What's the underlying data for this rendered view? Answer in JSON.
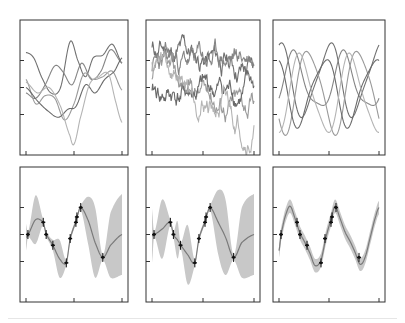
{
  "figure": {
    "title": "",
    "layout": {
      "rows": 2,
      "cols": 3
    },
    "colors": {
      "axis": "#333333",
      "sample_lines": [
        "#707070",
        "#858585",
        "#9a9a9a",
        "#6a6a6a",
        "#b4b4b4"
      ],
      "mean_line": "#7a7a7a",
      "band": "#c8c8c8",
      "observations": "#111111"
    }
  },
  "chart_data": [
    {
      "id": "prior-smooth",
      "type": "line",
      "title": "",
      "xlabel": "",
      "ylabel": "",
      "description": "Prior samples, smooth (RBF) kernel",
      "xlim": [
        0,
        1
      ],
      "ylim": [
        -2.5,
        2.5
      ],
      "x_ticks": [
        0,
        0.5,
        1
      ],
      "y_ticks": [
        -1,
        0,
        1
      ],
      "tick_labels": [],
      "grid": false,
      "legend": null,
      "series": [
        {
          "name": "sample 1",
          "x": [
            0,
            0.08,
            0.16,
            0.26,
            0.36,
            0.46,
            0.54,
            0.62,
            0.7,
            0.8,
            0.9,
            1.0
          ],
          "y": [
            1.3,
            1.1,
            0.4,
            -0.2,
            0.0,
            1.7,
            1.0,
            0.4,
            1.1,
            1.2,
            1.6,
            0.9
          ]
        },
        {
          "name": "sample 2",
          "x": [
            0,
            0.1,
            0.2,
            0.3,
            0.38,
            0.48,
            0.58,
            0.68,
            0.78,
            0.88,
            1.0
          ],
          "y": [
            -0.2,
            -0.4,
            0.1,
            0.8,
            0.6,
            0.1,
            0.9,
            0.3,
            0.6,
            1.4,
            0.9
          ]
        },
        {
          "name": "sample 3",
          "x": [
            0,
            0.1,
            0.2,
            0.3,
            0.4,
            0.5,
            0.6,
            0.7,
            0.8,
            0.9,
            1.0
          ],
          "y": [
            0.3,
            -0.6,
            -0.3,
            -0.4,
            -1.2,
            -0.6,
            0.5,
            0.3,
            0.4,
            0.6,
            -0.1
          ]
        },
        {
          "name": "sample 4",
          "x": [
            0,
            0.12,
            0.24,
            0.34,
            0.44,
            0.52,
            0.62,
            0.72,
            0.82,
            0.92,
            1.0
          ],
          "y": [
            0.0,
            -0.5,
            -0.9,
            -1.1,
            -0.8,
            -0.7,
            0.1,
            -0.2,
            0.3,
            0.6,
            1.1
          ]
        },
        {
          "name": "sample 5",
          "x": [
            0,
            0.12,
            0.24,
            0.36,
            0.46,
            0.5,
            0.56,
            0.66,
            0.76,
            0.86,
            0.94,
            1.0
          ],
          "y": [
            0.2,
            -0.2,
            0.0,
            -0.7,
            -1.8,
            -2.1,
            -1.2,
            0.1,
            0.4,
            0.5,
            -0.6,
            -1.3
          ]
        }
      ]
    },
    {
      "id": "prior-rough",
      "type": "line",
      "title": "",
      "xlabel": "",
      "ylabel": "",
      "description": "Prior samples, rough (Ornstein-Uhlenbeck / exponential) kernel",
      "xlim": [
        0,
        1
      ],
      "ylim": [
        -2.5,
        2.5
      ],
      "x_ticks": [
        0,
        0.5,
        1
      ],
      "y_ticks": [
        -1,
        0,
        1
      ],
      "tick_labels": [],
      "grid": false,
      "legend": null,
      "series": [
        {
          "name": "sample 1",
          "seed": 11,
          "start": 1.4,
          "end": 0.6
        },
        {
          "name": "sample 2",
          "seed": 23,
          "start": 0.8,
          "end": 1.2
        },
        {
          "name": "sample 3",
          "seed": 37,
          "start": 0.2,
          "end": -0.6
        },
        {
          "name": "sample 4",
          "seed": 41,
          "start": -0.3,
          "end": -0.1
        },
        {
          "name": "sample 5",
          "seed": 59,
          "start": 0.9,
          "end": -1.8
        }
      ]
    },
    {
      "id": "prior-periodic",
      "type": "line",
      "title": "",
      "xlabel": "",
      "ylabel": "",
      "description": "Prior samples, periodic kernel (period ~0.5)",
      "xlim": [
        0,
        1
      ],
      "ylim": [
        -2.5,
        2.5
      ],
      "x_ticks": [
        0,
        0.5,
        1
      ],
      "y_ticks": [
        -1,
        0,
        1
      ],
      "tick_labels": [],
      "grid": false,
      "legend": null,
      "series": [
        {
          "name": "sample 1",
          "amp": 1.3,
          "phase": 0.0,
          "offset": 0.9
        },
        {
          "name": "sample 2",
          "amp": 1.0,
          "phase": 0.15,
          "offset": 0.5
        },
        {
          "name": "sample 3",
          "amp": 1.5,
          "phase": 0.3,
          "offset": -0.3
        },
        {
          "name": "sample 4",
          "amp": 1.2,
          "phase": 0.45,
          "offset": -0.4
        },
        {
          "name": "sample 5",
          "amp": 1.4,
          "phase": 0.22,
          "offset": -0.9
        }
      ]
    },
    {
      "id": "posterior-smooth",
      "type": "line",
      "title": "",
      "xlabel": "",
      "ylabel": "",
      "description": "Posterior mean with uncertainty band, smooth kernel",
      "xlim": [
        0,
        1
      ],
      "ylim": [
        -2.5,
        2.5
      ],
      "x_ticks": [
        0,
        0.5,
        1
      ],
      "y_ticks": [
        -1,
        0,
        1
      ],
      "tick_labels": [],
      "grid": false,
      "legend": null,
      "observations": {
        "x": [
          0.02,
          0.18,
          0.21,
          0.28,
          0.42,
          0.46,
          0.52,
          0.53,
          0.57,
          0.8
        ],
        "y": [
          0.0,
          0.45,
          0.0,
          -0.4,
          -1.05,
          -0.15,
          0.45,
          0.65,
          1.0,
          -0.85
        ]
      },
      "mean": {
        "x": [
          0,
          0.02,
          0.1,
          0.18,
          0.21,
          0.28,
          0.35,
          0.42,
          0.46,
          0.52,
          0.53,
          0.57,
          0.65,
          0.72,
          0.8,
          0.88,
          1.0
        ],
        "y": [
          -0.1,
          0.0,
          0.55,
          0.45,
          0.0,
          -0.4,
          -0.9,
          -1.05,
          -0.15,
          0.45,
          0.65,
          1.0,
          0.5,
          -0.3,
          -0.85,
          -0.4,
          0.0
        ]
      },
      "band_halfwidth": [
        0.5,
        0.1,
        0.9,
        0.1,
        0.1,
        0.2,
        0.7,
        0.1,
        0.1,
        0.1,
        0.1,
        0.1,
        0.9,
        1.3,
        0.1,
        1.2,
        1.5
      ]
    },
    {
      "id": "posterior-rough",
      "type": "line",
      "title": "",
      "xlabel": "",
      "ylabel": "",
      "description": "Posterior mean with uncertainty band, rough kernel",
      "xlim": [
        0,
        1
      ],
      "ylim": [
        -2.5,
        2.5
      ],
      "x_ticks": [
        0,
        0.5,
        1
      ],
      "y_ticks": [
        -1,
        0,
        1
      ],
      "tick_labels": [],
      "grid": false,
      "legend": null,
      "observations": {
        "x": [
          0.02,
          0.18,
          0.21,
          0.28,
          0.42,
          0.46,
          0.52,
          0.53,
          0.57,
          0.8
        ],
        "y": [
          0.0,
          0.45,
          0.0,
          -0.4,
          -1.05,
          -0.15,
          0.45,
          0.65,
          1.0,
          -0.85
        ]
      },
      "mean": {
        "x": [
          0,
          0.02,
          0.1,
          0.18,
          0.21,
          0.25,
          0.28,
          0.35,
          0.42,
          0.46,
          0.52,
          0.53,
          0.57,
          0.65,
          0.72,
          0.8,
          0.88,
          1.0
        ],
        "y": [
          -0.05,
          0.0,
          0.2,
          0.45,
          0.0,
          -0.2,
          -0.4,
          -0.75,
          -1.05,
          -0.15,
          0.45,
          0.65,
          1.0,
          0.45,
          -0.1,
          -0.85,
          -0.3,
          0.0
        ]
      },
      "band_halfwidth": [
        1.0,
        0.1,
        1.1,
        0.1,
        0.1,
        0.7,
        0.1,
        1.1,
        0.1,
        0.1,
        0.1,
        0.1,
        0.1,
        1.2,
        1.4,
        0.1,
        1.3,
        1.5
      ]
    },
    {
      "id": "posterior-periodic",
      "type": "line",
      "title": "",
      "xlabel": "",
      "ylabel": "",
      "description": "Posterior mean with uncertainty band, periodic kernel",
      "xlim": [
        0,
        1
      ],
      "ylim": [
        -2.5,
        2.5
      ],
      "x_ticks": [
        0,
        0.5,
        1
      ],
      "y_ticks": [
        -1,
        0,
        1
      ],
      "tick_labels": [],
      "grid": false,
      "legend": null,
      "observations": {
        "x": [
          0.02,
          0.18,
          0.21,
          0.28,
          0.42,
          0.46,
          0.52,
          0.53,
          0.57,
          0.8
        ],
        "y": [
          0.0,
          0.45,
          0.0,
          -0.4,
          -1.05,
          -0.15,
          0.45,
          0.65,
          1.0,
          -0.85
        ]
      },
      "mean": {
        "x": [
          0,
          0.02,
          0.06,
          0.11,
          0.16,
          0.21,
          0.26,
          0.31,
          0.36,
          0.42,
          0.47,
          0.52,
          0.56,
          0.61,
          0.66,
          0.71,
          0.76,
          0.81,
          0.86,
          0.92,
          0.97,
          1.0
        ],
        "y": [
          -0.6,
          0.0,
          0.65,
          1.05,
          0.6,
          0.05,
          -0.3,
          -0.7,
          -1.15,
          -0.95,
          -0.1,
          0.55,
          1.05,
          0.6,
          0.1,
          -0.25,
          -0.65,
          -1.1,
          -0.85,
          0.0,
          0.7,
          1.0
        ]
      },
      "band_halfwidth": 0.25
    }
  ]
}
